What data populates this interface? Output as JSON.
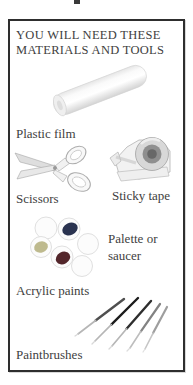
{
  "page": {
    "header": "YOU WILL NEED THESE MATERIALS AND TOOLS"
  },
  "items": [
    {
      "name": "plastic-film",
      "label": "Plastic film",
      "icon": "plastic-film-roll-icon"
    },
    {
      "name": "scissors",
      "label": "Scissors",
      "icon": "scissors-icon"
    },
    {
      "name": "sticky-tape",
      "label": "Sticky tape",
      "icon": "tape-dispenser-icon"
    },
    {
      "name": "palette",
      "label": "Palette or saucer",
      "icon": "palette-icon"
    },
    {
      "name": "acrylic-paints",
      "label": "Acrylic paints",
      "icon": "palette-icon"
    },
    {
      "name": "paintbrushes",
      "label": "Paintbrushes",
      "icon": "paintbrushes-icon"
    }
  ],
  "colors": {
    "frame_border": "#2e2e2e",
    "text": "#3e3e3e",
    "paint_blue": "#2a3350",
    "paint_olive": "#a9a express46a",
    "paint_olive_fix": "#a9a46a",
    "paint_maroon": "#53262b"
  }
}
